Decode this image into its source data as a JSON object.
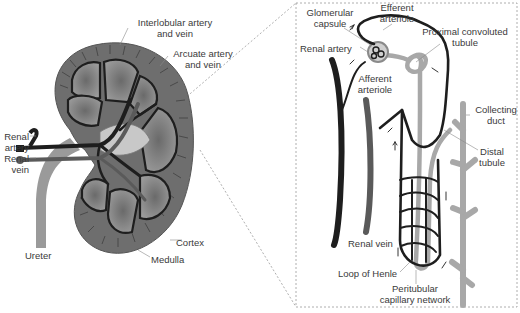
{
  "diagram": {
    "left_panel": {
      "name": "Kidney cross-section",
      "labels": [
        {
          "id": "interlobular",
          "line1": "Interlobular artery",
          "line2": "and vein",
          "x": 130,
          "y": 17,
          "align": "c",
          "w": 90
        },
        {
          "id": "arcuate",
          "line1": "Arcuate artery",
          "line2": "and vein",
          "x": 168,
          "y": 48,
          "align": "c",
          "w": 70
        },
        {
          "id": "renal-artery",
          "line1": "Renal",
          "line2": "artery",
          "x": 1,
          "y": 131,
          "align": "r",
          "w": 28
        },
        {
          "id": "renal-vein",
          "line1": "Renal",
          "line2": "vein",
          "x": 1,
          "y": 153,
          "align": "r",
          "w": 28
        },
        {
          "id": "ureter",
          "line1": "Ureter",
          "line2": "",
          "x": 25,
          "y": 250,
          "align": "l",
          "w": 40
        },
        {
          "id": "cortex",
          "line1": "Cortex",
          "line2": "",
          "x": 176,
          "y": 237,
          "align": "l",
          "w": 40
        },
        {
          "id": "medulla",
          "line1": "Medulla",
          "line2": "",
          "x": 151,
          "y": 254,
          "align": "l",
          "w": 45
        }
      ]
    },
    "right_panel": {
      "name": "Nephron detail",
      "labels": [
        {
          "id": "glomerular-capsule",
          "line1": "Glomerular",
          "line2": "capsule",
          "x": 300,
          "y": 7,
          "align": "c",
          "w": 60
        },
        {
          "id": "efferent-arteriole",
          "line1": "Efferent",
          "line2": "arteriole",
          "x": 372,
          "y": 2,
          "align": "c",
          "w": 50
        },
        {
          "id": "proximal-tubule",
          "line1": "Proximal convoluted",
          "line2": "tubule",
          "x": 415,
          "y": 26,
          "align": "c",
          "w": 100
        },
        {
          "id": "renal-artery-n",
          "line1": "Renal artery",
          "line2": "",
          "x": 300,
          "y": 43,
          "align": "l",
          "w": 60
        },
        {
          "id": "afferent-arteriole",
          "line1": "Afferent",
          "line2": "arteriole",
          "x": 352,
          "y": 73,
          "align": "c",
          "w": 46
        },
        {
          "id": "collecting-duct",
          "line1": "Collecting",
          "line2": "duct",
          "x": 473,
          "y": 104,
          "align": "c",
          "w": 46
        },
        {
          "id": "distal-tubule",
          "line1": "Distal",
          "line2": "tubule",
          "x": 472,
          "y": 146,
          "align": "c",
          "w": 40
        },
        {
          "id": "renal-vein-n",
          "line1": "Renal vein",
          "line2": "",
          "x": 348,
          "y": 238,
          "align": "l",
          "w": 60
        },
        {
          "id": "loop-of-henle",
          "line1": "Loop of Henle",
          "line2": "",
          "x": 338,
          "y": 268,
          "align": "l",
          "w": 80
        },
        {
          "id": "peritubular",
          "line1": "Peritubular",
          "line2": "capillary network",
          "x": 370,
          "y": 283,
          "align": "c",
          "w": 90
        }
      ]
    },
    "colors": {
      "cortex": "#6e6e6e",
      "medulla_pyramid": "#8c8c8c",
      "vessel_dark": "#1e1e1e",
      "vessel_mid": "#5a5a5a",
      "tubule_light": "#a8a8a8",
      "dashed_line": "#9a9a9a",
      "label_text": "#3a3a3a"
    }
  }
}
